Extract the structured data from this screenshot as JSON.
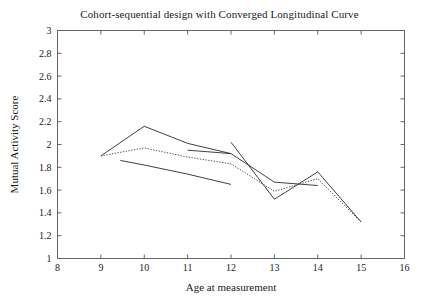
{
  "chart_data": {
    "type": "line",
    "title": "Cohort-sequential design with Converged Longitudinal Curve",
    "xlabel": "Age at measurement",
    "ylabel": "Mutual Activity Score",
    "xlim": [
      8,
      16
    ],
    "ylim": [
      1,
      3
    ],
    "xticks": [
      8,
      9,
      10,
      11,
      12,
      13,
      14,
      15,
      16
    ],
    "xtick_labels": [
      "8",
      "9",
      "10",
      "11",
      "12",
      "13",
      "14",
      "15",
      "16"
    ],
    "yticks": [
      1,
      1.2,
      1.4,
      1.6,
      1.8,
      2,
      2.2,
      2.4,
      2.6,
      2.8,
      3
    ],
    "ytick_labels": [
      "1",
      "1.2",
      "1.4",
      "1.6",
      "1.8",
      "2",
      "2.2",
      "2.4",
      "2.6",
      "2.8",
      "3"
    ],
    "grid": false,
    "legend": "none",
    "series": [
      {
        "name": "Cohort 1 (ages 9-12)",
        "style": "solid",
        "color": "#2a2a2a",
        "x": [
          9,
          10,
          11,
          12
        ],
        "values": [
          1.9,
          2.16,
          2.01,
          1.92
        ]
      },
      {
        "name": "Cohort 2 (ages 9-12)",
        "style": "solid",
        "color": "#2a2a2a",
        "x": [
          9.45,
          10,
          11,
          12
        ],
        "values": [
          1.86,
          1.82,
          1.74,
          1.65
        ]
      },
      {
        "name": "Cohort 3 (ages 11-14)",
        "style": "solid",
        "color": "#2a2a2a",
        "x": [
          11,
          12,
          13,
          14
        ],
        "values": [
          1.95,
          1.92,
          1.67,
          1.64
        ]
      },
      {
        "name": "Cohort 4 (ages 12-15)",
        "style": "solid",
        "color": "#2a2a2a",
        "x": [
          12,
          13,
          14,
          15
        ],
        "values": [
          2.02,
          1.52,
          1.76,
          1.32
        ]
      },
      {
        "name": "Converged longitudinal curve",
        "style": "dotted",
        "color": "#3a3a3a",
        "x": [
          9,
          10,
          11,
          12,
          13,
          14,
          15
        ],
        "values": [
          1.9,
          1.97,
          1.89,
          1.83,
          1.59,
          1.7,
          1.32
        ]
      }
    ]
  }
}
